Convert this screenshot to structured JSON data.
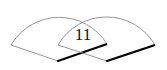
{
  "diagram": {
    "type": "overlapping-sectors",
    "overlap_label": "11",
    "colors": {
      "outline": "#8a8a8a",
      "bold_edge": "#000000",
      "background": "#ffffff",
      "text": "#111111"
    },
    "sectors": [
      {
        "name": "left-sector",
        "vertex": [
          58,
          61
        ],
        "left_corner": [
          11,
          45
        ],
        "right_corner": [
          107,
          44
        ]
      },
      {
        "name": "right-sector",
        "vertex": [
          107,
          61
        ],
        "left_corner": [
          58,
          45
        ],
        "right_corner": [
          155,
          45
        ]
      }
    ]
  }
}
